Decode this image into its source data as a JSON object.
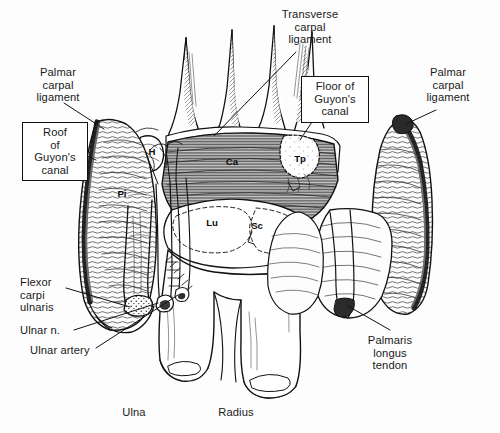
{
  "figure": {
    "background_color": "#fdfdfd",
    "ink_color": "#111111",
    "width": 500,
    "height": 433
  },
  "labels": {
    "palmar_carpal_ligament_left": "Palmar\ncarpal\nligament",
    "roof_of_guyons_canal": "Roof\nof\nGuyon's\ncanal",
    "transverse_carpal_ligament": "Transverse\ncarpal\nligament",
    "floor_of_guyons_canal": "Floor of\nGuyon's\ncanal",
    "palmar_carpal_ligament_right": "Palmar\ncarpal\nligament",
    "flexor_carpi_ulnaris": "Flexor\ncarpi\nulnaris",
    "ulnar_nerve": "Ulnar n.",
    "ulnar_artery": "Ulnar artery",
    "palmaris_longus_tendon": "Palmaris\nlongus\ntendon",
    "ulna": "Ulna",
    "radius": "Radius"
  },
  "bone_abbreviations": [
    {
      "key": "hamate",
      "text": "H",
      "x": 152,
      "y": 152
    },
    {
      "key": "pisiform",
      "text": "Pi",
      "x": 122,
      "y": 194
    },
    {
      "key": "capitate",
      "text": "Ca",
      "x": 232,
      "y": 162
    },
    {
      "key": "trapezium",
      "text": "Tp",
      "x": 300,
      "y": 159
    },
    {
      "key": "lunate",
      "text": "Lu",
      "x": 212,
      "y": 223
    },
    {
      "key": "scaphoid",
      "text": "Sc",
      "x": 257,
      "y": 226
    }
  ]
}
